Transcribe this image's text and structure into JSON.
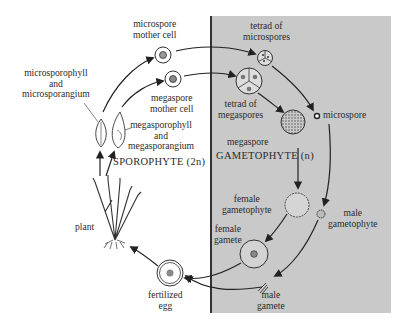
{
  "diagram": {
    "colors": {
      "gametophyte_panel": "#c9c9c9",
      "ink": "#2a2a2a",
      "background": "#ffffff"
    },
    "phases": {
      "sporophyte": "SPOROPHYTE (2n)",
      "gametophyte": "GAMETOPHYTE (n)"
    },
    "labels": {
      "microspore_mother_cell": [
        "microspore",
        "mother cell"
      ],
      "megaspore_mother_cell": [
        "megaspore",
        "mother cell"
      ],
      "microsporophyll": [
        "microsporophyll",
        "and",
        "microsporangium"
      ],
      "megasporophyll": [
        "megasporophyll",
        "and",
        "megasporangium"
      ],
      "tetrad_microspores": [
        "tetrad of",
        "microspores"
      ],
      "tetrad_megaspores": [
        "tetrad of",
        "megaspores"
      ],
      "microspore": "microspore",
      "megaspore": "megaspore",
      "female_gametophyte": [
        "female",
        "gametophyte"
      ],
      "male_gametophyte": [
        "male",
        "gametophyte"
      ],
      "female_gamete": [
        "female",
        "gamete"
      ],
      "male_gamete": [
        "male",
        "gamete"
      ],
      "fertilized_egg": [
        "fertilized",
        "egg"
      ],
      "plant": "plant"
    }
  }
}
